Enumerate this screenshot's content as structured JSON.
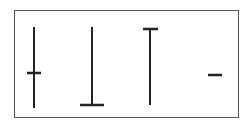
{
  "diagram": {
    "type": "candlestick-doji-patterns",
    "stroke_color": "#222222",
    "frame_color": "#555555",
    "shapes": [
      {
        "name": "long-legged-doji",
        "wick": {
          "x": 34,
          "y1": 27,
          "y2": 108
        },
        "body": {
          "y": 73,
          "x1": 27,
          "x2": 41
        }
      },
      {
        "name": "dragonfly-doji",
        "wick": {
          "x": 92,
          "y1": 27,
          "y2": 105
        },
        "body": {
          "y": 105,
          "x1": 80,
          "x2": 104
        }
      },
      {
        "name": "gravestone-doji",
        "wick": {
          "x": 150,
          "y1": 29,
          "y2": 105
        },
        "body": {
          "y": 29,
          "x1": 143,
          "x2": 158
        }
      },
      {
        "name": "four-price-doji",
        "wick": null,
        "body": {
          "y": 75,
          "x1": 208,
          "x2": 222
        }
      }
    ]
  }
}
